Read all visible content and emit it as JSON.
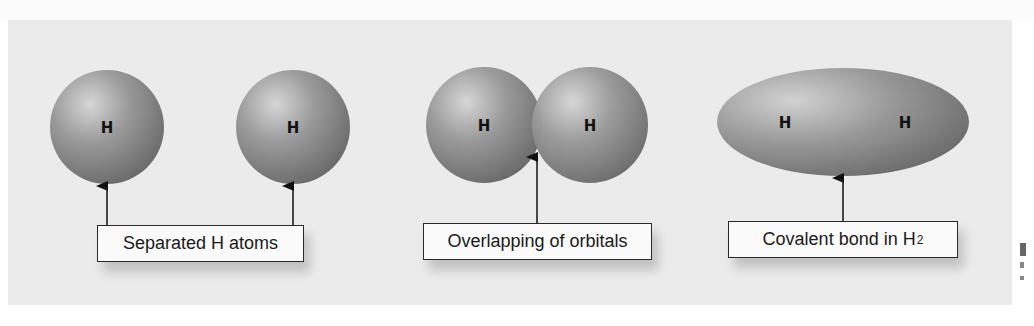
{
  "figure": {
    "background_color": "#ebebeb",
    "sphere_color": "#8a8a8a",
    "panels": [
      {
        "id": "separated",
        "label": "Separated H atoms",
        "atoms": [
          {
            "symbol": "H",
            "cx": 107,
            "cy": 127,
            "r": 57
          },
          {
            "symbol": "H",
            "cx": 293,
            "cy": 127,
            "r": 57
          }
        ]
      },
      {
        "id": "overlapping",
        "label": "Overlapping of orbitals",
        "atoms": [
          {
            "symbol": "H",
            "cx": 484,
            "cy": 125,
            "r": 58
          },
          {
            "symbol": "H",
            "cx": 590,
            "cy": 125,
            "r": 58
          }
        ]
      },
      {
        "id": "covalent",
        "label": "Covalent bond in H",
        "label_subscript": "2",
        "atoms": [
          {
            "symbol": "H",
            "x": 785
          },
          {
            "symbol": "H",
            "x": 905
          }
        ]
      }
    ]
  }
}
